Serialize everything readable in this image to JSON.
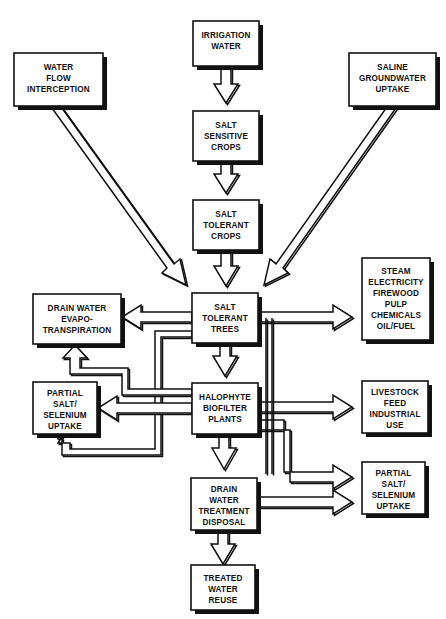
{
  "diagram": {
    "canvas": {
      "width": 446,
      "height": 619,
      "background": "#ffffff"
    },
    "style": {
      "line_color": "#111111",
      "box_fill": "#ffffff",
      "shadow_color": "#111111"
    },
    "nodes": [
      {
        "id": "irrigation-water",
        "lines": [
          "IRRIGATION",
          "WATER"
        ],
        "x": 193,
        "y": 21,
        "w": 66,
        "h": 45
      },
      {
        "id": "water-flow-interception",
        "lines": [
          "WATER",
          "FLOW",
          "INTERCEPTION"
        ],
        "x": 14,
        "y": 53,
        "w": 89,
        "h": 53
      },
      {
        "id": "saline-groundwater-uptake",
        "lines": [
          "SALINE",
          "GROUNDWATER",
          "UPTAKE"
        ],
        "x": 349,
        "y": 53,
        "w": 87,
        "h": 53
      },
      {
        "id": "salt-sensitive-crops",
        "lines": [
          "SALT",
          "SENSITIVE",
          "CROPS"
        ],
        "x": 193,
        "y": 111,
        "w": 66,
        "h": 50
      },
      {
        "id": "salt-tolerant-crops",
        "lines": [
          "SALT",
          "TOLERANT",
          "CROPS"
        ],
        "x": 193,
        "y": 200,
        "w": 66,
        "h": 50
      },
      {
        "id": "salt-tolerant-trees",
        "lines": [
          "SALT",
          "TOLERANT",
          "TREES"
        ],
        "x": 192,
        "y": 293,
        "w": 66,
        "h": 50
      },
      {
        "id": "drain-water-evapotranspiration",
        "lines": [
          "DRAIN WATER",
          "EVAPO-",
          "TRANSPIRATION"
        ],
        "x": 33,
        "y": 294,
        "w": 88,
        "h": 50
      },
      {
        "id": "steam-electricity-products",
        "lines": [
          "STEAM",
          "ELECTRICITY",
          "FIREWOOD",
          "PULP",
          "CHEMICALS",
          "OIL/FUEL"
        ],
        "x": 362,
        "y": 258,
        "w": 68,
        "h": 82
      },
      {
        "id": "partial-salt-selenium-uptake-left",
        "lines": [
          "PARTIAL",
          "SALT/",
          "SELENIUM",
          "UPTAKE"
        ],
        "x": 33,
        "y": 382,
        "w": 64,
        "h": 52
      },
      {
        "id": "halophyte-biofilter-plants",
        "lines": [
          "HALOPHYTE",
          "BIOFILTER",
          "PLANTS"
        ],
        "x": 192,
        "y": 383,
        "w": 66,
        "h": 51
      },
      {
        "id": "livestock-feed-industrial-use",
        "lines": [
          "LIVESTOCK",
          "FEED",
          "INDUSTRIAL",
          "USE"
        ],
        "x": 362,
        "y": 381,
        "w": 66,
        "h": 52
      },
      {
        "id": "drain-water-treatment-disposal",
        "lines": [
          "DRAIN",
          "WATER",
          "TREATMENT",
          "DISPOSAL"
        ],
        "x": 191,
        "y": 478,
        "w": 66,
        "h": 52
      },
      {
        "id": "partial-salt-selenium-uptake-right",
        "lines": [
          "PARTIAL",
          "SALT/",
          "SELENIUM",
          "UPTAKE"
        ],
        "x": 362,
        "y": 462,
        "w": 63,
        "h": 52
      },
      {
        "id": "treated-water-reuse",
        "lines": [
          "TREATED",
          "WATER",
          "REUSE"
        ],
        "x": 191,
        "y": 565,
        "w": 64,
        "h": 45
      }
    ],
    "connections": [
      {
        "id": "irrigation-to-salt-sensitive",
        "from": "irrigation-water",
        "to": "salt-sensitive-crops",
        "kind": "vertical-down"
      },
      {
        "id": "salt-sensitive-to-salt-tolerant-crops",
        "from": "salt-sensitive-crops",
        "to": "salt-tolerant-crops",
        "kind": "vertical-down"
      },
      {
        "id": "salt-tolerant-crops-to-trees",
        "from": "salt-tolerant-crops",
        "to": "salt-tolerant-trees",
        "kind": "vertical-down"
      },
      {
        "id": "water-flow-interception-to-trees",
        "from": "water-flow-interception",
        "to": "salt-tolerant-trees",
        "kind": "diagonal"
      },
      {
        "id": "saline-groundwater-to-trees",
        "from": "saline-groundwater-uptake",
        "to": "salt-tolerant-trees",
        "kind": "diagonal"
      },
      {
        "id": "trees-to-evapotranspiration",
        "from": "salt-tolerant-trees",
        "to": "drain-water-evapotranspiration",
        "kind": "horizontal-left"
      },
      {
        "id": "trees-to-steam-products",
        "from": "salt-tolerant-trees",
        "to": "steam-electricity-products",
        "kind": "horizontal-right"
      },
      {
        "id": "trees-to-halophyte",
        "from": "salt-tolerant-trees",
        "to": "halophyte-biofilter-plants",
        "kind": "vertical-down"
      },
      {
        "id": "trees-to-partial-salt-left",
        "from": "salt-tolerant-trees",
        "to": "partial-salt-selenium-uptake-left",
        "kind": "routed-left"
      },
      {
        "id": "halophyte-to-evapotranspiration",
        "from": "halophyte-biofilter-plants",
        "to": "drain-water-evapotranspiration",
        "kind": "routed-left-up"
      },
      {
        "id": "halophyte-to-partial-salt-left",
        "from": "halophyte-biofilter-plants",
        "to": "partial-salt-selenium-uptake-left",
        "kind": "horizontal-left"
      },
      {
        "id": "halophyte-to-livestock-feed",
        "from": "halophyte-biofilter-plants",
        "to": "livestock-feed-industrial-use",
        "kind": "horizontal-right"
      },
      {
        "id": "halophyte-to-partial-salt-right",
        "from": "halophyte-biofilter-plants",
        "to": "partial-salt-selenium-uptake-right",
        "kind": "routed-right-down"
      },
      {
        "id": "halophyte-to-drain-treatment",
        "from": "halophyte-biofilter-plants",
        "to": "drain-water-treatment-disposal",
        "kind": "vertical-down"
      },
      {
        "id": "drain-treatment-to-partial-salt-right",
        "from": "drain-water-treatment-disposal",
        "to": "partial-salt-selenium-uptake-right",
        "kind": "horizontal-right"
      },
      {
        "id": "drain-treatment-to-treated-water-reuse",
        "from": "drain-water-treatment-disposal",
        "to": "treated-water-reuse",
        "kind": "vertical-down"
      }
    ]
  }
}
